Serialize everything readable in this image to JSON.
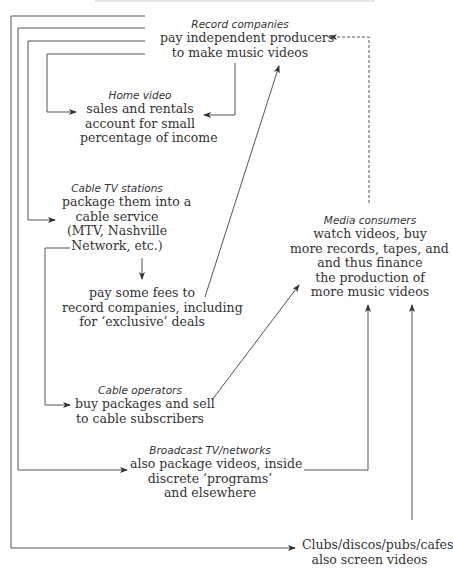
{
  "diagram": {
    "nodes": {
      "record_companies": {
        "title": "Record companies",
        "lines": [
          "pay independent producers",
          "to make music videos"
        ]
      },
      "home_video": {
        "title": "Home video",
        "lines": [
          "sales and rentals",
          "account for small",
          "percentage of income"
        ]
      },
      "cable_tv_stations": {
        "title": "Cable TV stations",
        "lines": [
          "package them into a",
          "cable service",
          "(MTV, Nashville",
          "Network, etc.)"
        ]
      },
      "pay_fees": {
        "title": "",
        "lines": [
          "pay some fees to",
          "record companies, including",
          "for ‘exclusive’ deals"
        ]
      },
      "cable_operators": {
        "title": "Cable operators",
        "lines": [
          "buy packages and sell",
          "to cable subscribers"
        ]
      },
      "broadcast_tv": {
        "title": "Broadcast TV/networks",
        "lines": [
          "also package videos, inside",
          "discrete ‘programs’",
          "and elsewhere"
        ]
      },
      "media_consumers": {
        "title": "Media consumers",
        "lines": [
          "watch videos, buy",
          "more records, tapes, and CDs,",
          "and thus finance",
          "the production of",
          "more music videos"
        ]
      },
      "clubs": {
        "title": "",
        "lines": [
          "Clubs/discos/pubs/cafes",
          "also screen videos"
        ]
      }
    },
    "colors": {
      "line": "#555555",
      "text": "#333333",
      "background": "#ffffff"
    }
  }
}
